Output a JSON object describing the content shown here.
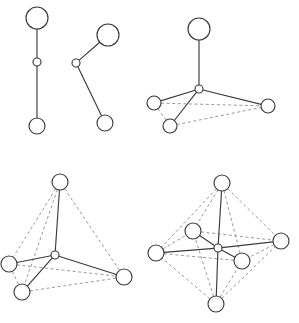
{
  "figure": {
    "background_color": "#ffffff",
    "bond_solid_color": "#3a3a44",
    "bond_dashed_color": "#8d8d96",
    "atom_fill_color": "#ffffff",
    "atom_stroke_color": "#3a3a44",
    "width": 299,
    "height": 323
  },
  "panels": [
    {
      "id": "panel-linear",
      "name": "linear-two-coordinate",
      "label": "",
      "coordination_number": 2,
      "geometry": "linear",
      "atoms": [
        {
          "name": "ligand-top",
          "role": "ligand",
          "cx": 37,
          "cy": 18,
          "r": 11
        },
        {
          "name": "metal-center",
          "role": "center",
          "cx": 37,
          "cy": 62,
          "r": 4
        },
        {
          "name": "ligand-bottom",
          "role": "ligand",
          "cx": 37,
          "cy": 126,
          "r": 8
        }
      ],
      "solid_bonds": [
        {
          "from": "ligand-top",
          "to": "metal-center"
        },
        {
          "from": "metal-center",
          "to": "ligand-bottom"
        }
      ],
      "dashed_bonds": []
    },
    {
      "id": "panel-bent",
      "name": "bent-two-coordinate",
      "label": "",
      "coordination_number": 2,
      "geometry": "bent",
      "atoms": [
        {
          "name": "ligand-upper-right",
          "role": "ligand",
          "cx": 108,
          "cy": 35,
          "r": 11
        },
        {
          "name": "metal-center",
          "role": "center",
          "cx": 76,
          "cy": 63,
          "r": 4
        },
        {
          "name": "ligand-lower-right",
          "role": "ligand",
          "cx": 105,
          "cy": 123,
          "r": 8
        }
      ],
      "solid_bonds": [
        {
          "from": "ligand-upper-right",
          "to": "metal-center"
        },
        {
          "from": "metal-center",
          "to": "ligand-lower-right"
        }
      ],
      "dashed_bonds": []
    },
    {
      "id": "panel-trigonal-pyramidal",
      "name": "four-coordinate-trigonal-pyramidal",
      "label": "",
      "coordination_number": 4,
      "geometry": "trigonal pyramidal / distorted tetrahedral",
      "atoms": [
        {
          "name": "ligand-apex",
          "role": "ligand",
          "cx": 199,
          "cy": 29,
          "r": 11
        },
        {
          "name": "metal-center",
          "role": "center",
          "cx": 199,
          "cy": 89,
          "r": 4
        },
        {
          "name": "ligand-left",
          "role": "ligand",
          "cx": 154,
          "cy": 103,
          "r": 7
        },
        {
          "name": "ligand-front",
          "role": "ligand",
          "cx": 170,
          "cy": 126,
          "r": 7
        },
        {
          "name": "ligand-right",
          "role": "ligand",
          "cx": 268,
          "cy": 106,
          "r": 7
        }
      ],
      "solid_bonds": [
        {
          "from": "ligand-apex",
          "to": "metal-center"
        },
        {
          "from": "metal-center",
          "to": "ligand-left"
        },
        {
          "from": "metal-center",
          "to": "ligand-front"
        },
        {
          "from": "metal-center",
          "to": "ligand-right"
        }
      ],
      "dashed_bonds": [
        {
          "from": "ligand-left",
          "to": "ligand-front"
        },
        {
          "from": "ligand-left",
          "to": "ligand-right"
        },
        {
          "from": "ligand-front",
          "to": "ligand-right"
        }
      ]
    },
    {
      "id": "panel-tetrahedral",
      "name": "four-coordinate-tetrahedral",
      "label": "",
      "coordination_number": 4,
      "geometry": "tetrahedral",
      "atoms": [
        {
          "name": "ligand-apex",
          "role": "ligand",
          "cx": 60,
          "cy": 182,
          "r": 8
        },
        {
          "name": "metal-center",
          "role": "center",
          "cx": 55,
          "cy": 255,
          "r": 4
        },
        {
          "name": "ligand-left",
          "role": "ligand",
          "cx": 9,
          "cy": 264,
          "r": 8
        },
        {
          "name": "ligand-front",
          "role": "ligand",
          "cx": 22,
          "cy": 292,
          "r": 8
        },
        {
          "name": "ligand-right",
          "role": "ligand",
          "cx": 124,
          "cy": 277,
          "r": 8
        }
      ],
      "solid_bonds": [
        {
          "from": "ligand-apex",
          "to": "metal-center"
        },
        {
          "from": "metal-center",
          "to": "ligand-left"
        },
        {
          "from": "metal-center",
          "to": "ligand-front"
        },
        {
          "from": "metal-center",
          "to": "ligand-right"
        }
      ],
      "dashed_bonds": [
        {
          "from": "ligand-apex",
          "to": "ligand-left"
        },
        {
          "from": "ligand-apex",
          "to": "ligand-front"
        },
        {
          "from": "ligand-apex",
          "to": "ligand-right"
        },
        {
          "from": "ligand-left",
          "to": "ligand-front"
        },
        {
          "from": "ligand-left",
          "to": "ligand-right"
        },
        {
          "from": "ligand-front",
          "to": "ligand-right"
        }
      ]
    },
    {
      "id": "panel-octahedral",
      "name": "six-coordinate-octahedral",
      "label": "",
      "coordination_number": 6,
      "geometry": "octahedral",
      "atoms": [
        {
          "name": "ligand-axial-top",
          "role": "ligand",
          "cx": 222,
          "cy": 183,
          "r": 8
        },
        {
          "name": "metal-center",
          "role": "center",
          "cx": 218,
          "cy": 248,
          "r": 4
        },
        {
          "name": "ligand-equatorial-left",
          "role": "ligand",
          "cx": 156,
          "cy": 253,
          "r": 8
        },
        {
          "name": "ligand-equatorial-right",
          "role": "ligand",
          "cx": 281,
          "cy": 241,
          "r": 8
        },
        {
          "name": "ligand-equatorial-back",
          "role": "ligand",
          "cx": 193,
          "cy": 231,
          "r": 8
        },
        {
          "name": "ligand-equatorial-front",
          "role": "ligand",
          "cx": 242,
          "cy": 261,
          "r": 8
        },
        {
          "name": "ligand-axial-bottom",
          "role": "ligand",
          "cx": 216,
          "cy": 304,
          "r": 8
        }
      ],
      "solid_bonds": [
        {
          "from": "ligand-axial-top",
          "to": "metal-center"
        },
        {
          "from": "metal-center",
          "to": "ligand-axial-bottom"
        },
        {
          "from": "metal-center",
          "to": "ligand-equatorial-left"
        },
        {
          "from": "metal-center",
          "to": "ligand-equatorial-right"
        },
        {
          "from": "metal-center",
          "to": "ligand-equatorial-back"
        },
        {
          "from": "metal-center",
          "to": "ligand-equatorial-front"
        }
      ],
      "dashed_bonds": [
        {
          "from": "ligand-axial-top",
          "to": "ligand-equatorial-left"
        },
        {
          "from": "ligand-axial-top",
          "to": "ligand-equatorial-right"
        },
        {
          "from": "ligand-axial-top",
          "to": "ligand-equatorial-back"
        },
        {
          "from": "ligand-axial-top",
          "to": "ligand-equatorial-front"
        },
        {
          "from": "ligand-axial-bottom",
          "to": "ligand-equatorial-left"
        },
        {
          "from": "ligand-axial-bottom",
          "to": "ligand-equatorial-right"
        },
        {
          "from": "ligand-axial-bottom",
          "to": "ligand-equatorial-back"
        },
        {
          "from": "ligand-axial-bottom",
          "to": "ligand-equatorial-front"
        },
        {
          "from": "ligand-equatorial-left",
          "to": "ligand-equatorial-back"
        },
        {
          "from": "ligand-equatorial-back",
          "to": "ligand-equatorial-right"
        },
        {
          "from": "ligand-equatorial-right",
          "to": "ligand-equatorial-front"
        },
        {
          "from": "ligand-equatorial-front",
          "to": "ligand-equatorial-left"
        }
      ]
    }
  ]
}
